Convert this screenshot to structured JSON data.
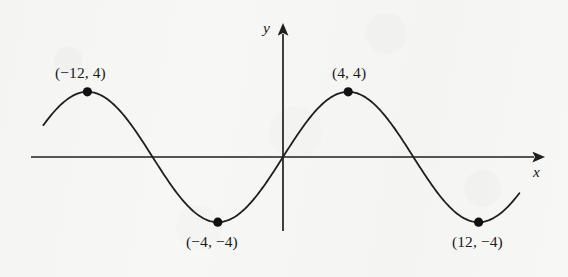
{
  "figure": {
    "kind": "coordinate-plane-sine-curve",
    "background_color": "#f7f7f5",
    "ink_color": "#1f1f1f"
  },
  "axes": {
    "x_label": "x",
    "y_label": "y",
    "origin_px": [
      283,
      157
    ],
    "px_per_unit": 16.3,
    "x_axis_start_px": 31,
    "x_axis_end_px": 541,
    "y_axis_top_px": 27,
    "y_axis_bottom_px": 231
  },
  "chart_data": {
    "type": "line",
    "title": "",
    "xlabel": "x",
    "ylabel": "y",
    "grid": false,
    "legend": null,
    "xlim": [
      -15.5,
      15.8
    ],
    "ylim": [
      -8.0,
      8.0
    ],
    "curve": {
      "name": "sine wave",
      "equation": "y = 4 sin(pi x / 8)",
      "amplitude": 4,
      "period": 16,
      "phase": 0,
      "x_intercepts": [
        -16,
        -8,
        0,
        8,
        16
      ],
      "x_start": -14.7,
      "x_end": 14.5
    },
    "labeled_points": [
      {
        "label": "(−12, 4)",
        "x": -12,
        "y": 4,
        "label_position": "above"
      },
      {
        "label": "(4, 4)",
        "x": 4,
        "y": 4,
        "label_position": "above"
      },
      {
        "label": "(−4, −4)",
        "x": -4,
        "y": -4,
        "label_position": "below"
      },
      {
        "label": "(12, −4)",
        "x": 12,
        "y": -4,
        "label_position": "below"
      }
    ],
    "annotations": []
  },
  "labels": {
    "max_left": "(−12, 4)",
    "max_right": "(4, 4)",
    "min_left": "(−4, −4)",
    "min_right": "(12, −4)",
    "axis_x": "x",
    "axis_y": "y"
  }
}
